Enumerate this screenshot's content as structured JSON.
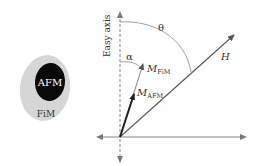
{
  "diagram": {
    "particle": {
      "core_label": "AFM",
      "shell_label": "FiM",
      "core_color": "#0a0a0a",
      "shell_color": "#d6d6d6"
    },
    "axes": {
      "easy_axis_label": "Easy axis",
      "axis_color": "#666666"
    },
    "vectors": {
      "field_label": "H",
      "fim_label_main": "M",
      "fim_label_sub": "FiM",
      "afm_label_main": "M",
      "afm_label_sub": "AFM",
      "arrow_color": "#444444",
      "afm_arrow_color": "#222222"
    },
    "angles": {
      "theta_label": "θ",
      "alpha_label": "α"
    }
  }
}
